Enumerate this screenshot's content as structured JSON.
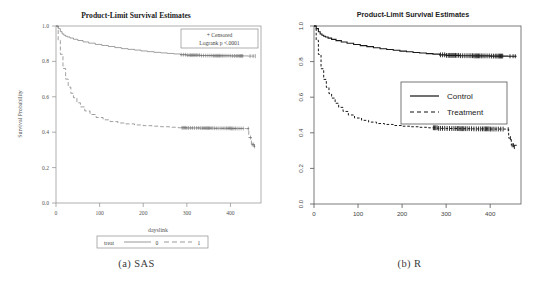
{
  "figure": {
    "subfigures": [
      {
        "key": "sas",
        "caption": "(a) SAS"
      },
      {
        "key": "r",
        "caption": "(b) R"
      }
    ]
  },
  "chart_data": [
    {
      "id": "sas",
      "type": "line",
      "software": "SAS",
      "title": "Product-Limit Survival Estimates",
      "xlabel": "dayslink",
      "ylabel": "Survival Probability",
      "xlim": [
        0,
        470
      ],
      "ylim": [
        0.0,
        1.0
      ],
      "xticks": [
        0,
        100,
        200,
        300,
        400
      ],
      "yticks": [
        0.0,
        0.2,
        0.4,
        0.6,
        0.8,
        1.0
      ],
      "xticklabels": [
        "0",
        "100",
        "200",
        "300",
        "400"
      ],
      "yticklabels": [
        "0.0",
        "0.2",
        "0.4",
        "0.6",
        "0.8",
        "1.0"
      ],
      "grid": false,
      "annotation_box": {
        "censored_note": "+ Censored",
        "logrank_note": "Logrank p <.0001"
      },
      "legend": {
        "position": "below-axis",
        "title": "treat",
        "entries": [
          {
            "label": "0",
            "style": "solid"
          },
          {
            "label": "1",
            "style": "dashed"
          }
        ]
      },
      "series": [
        {
          "name": "0",
          "style": "solid",
          "x": [
            0,
            5,
            10,
            14,
            18,
            22,
            26,
            32,
            40,
            50,
            62,
            75,
            90,
            105,
            120,
            135,
            150,
            165,
            180,
            195,
            210,
            225,
            240,
            255,
            270,
            285,
            300,
            330,
            360,
            400,
            440,
            455
          ],
          "y": [
            1.0,
            0.985,
            0.968,
            0.955,
            0.948,
            0.942,
            0.938,
            0.932,
            0.925,
            0.918,
            0.91,
            0.903,
            0.896,
            0.89,
            0.884,
            0.878,
            0.872,
            0.868,
            0.864,
            0.859,
            0.855,
            0.851,
            0.848,
            0.845,
            0.842,
            0.838,
            0.835,
            0.833,
            0.832,
            0.831,
            0.83,
            0.83
          ]
        },
        {
          "name": "1",
          "style": "dashed",
          "x": [
            0,
            5,
            10,
            16,
            22,
            28,
            34,
            40,
            48,
            56,
            66,
            78,
            92,
            108,
            124,
            142,
            160,
            180,
            200,
            220,
            240,
            260,
            280,
            300,
            330,
            360,
            400,
            435,
            442,
            448,
            455
          ],
          "y": [
            1.0,
            0.92,
            0.84,
            0.76,
            0.7,
            0.655,
            0.62,
            0.595,
            0.566,
            0.543,
            0.52,
            0.5,
            0.483,
            0.47,
            0.46,
            0.452,
            0.447,
            0.441,
            0.437,
            0.434,
            0.431,
            0.428,
            0.425,
            0.424,
            0.423,
            0.422,
            0.421,
            0.42,
            0.37,
            0.33,
            0.32
          ]
        }
      ],
      "censor_marks": {
        "series_0_range": [
          287,
          455
        ],
        "series_1_range": [
          288,
          455
        ]
      }
    },
    {
      "id": "r",
      "type": "line",
      "software": "R",
      "title": "Product-Limit Survival Estimates",
      "xlabel": "",
      "ylabel": "",
      "xlim": [
        0,
        470
      ],
      "ylim": [
        0.0,
        1.0
      ],
      "xticks": [
        0,
        100,
        200,
        300,
        400
      ],
      "yticks": [
        0.0,
        0.2,
        0.4,
        0.6,
        0.8,
        1.0
      ],
      "xticklabels": [
        "0",
        "100",
        "200",
        "300",
        "400"
      ],
      "yticklabels": [
        "0.0",
        "0.2",
        "0.4",
        "0.6",
        "0.8",
        "1.0"
      ],
      "grid": false,
      "legend": {
        "position": "inside-right",
        "entries": [
          {
            "label": "Control",
            "style": "solid"
          },
          {
            "label": "Treatment",
            "style": "dashed"
          }
        ]
      },
      "series": [
        {
          "name": "Control",
          "style": "solid",
          "x": [
            0,
            5,
            10,
            14,
            18,
            22,
            26,
            32,
            40,
            50,
            62,
            75,
            90,
            105,
            120,
            135,
            150,
            165,
            180,
            195,
            210,
            225,
            240,
            255,
            270,
            285,
            300,
            330,
            360,
            400,
            440,
            460
          ],
          "y": [
            1.0,
            0.985,
            0.968,
            0.955,
            0.948,
            0.942,
            0.938,
            0.932,
            0.925,
            0.918,
            0.91,
            0.903,
            0.896,
            0.89,
            0.884,
            0.878,
            0.872,
            0.868,
            0.864,
            0.859,
            0.855,
            0.851,
            0.848,
            0.845,
            0.842,
            0.838,
            0.835,
            0.833,
            0.832,
            0.831,
            0.83,
            0.83
          ]
        },
        {
          "name": "Treatment",
          "style": "dashed",
          "x": [
            0,
            5,
            10,
            16,
            22,
            28,
            34,
            40,
            48,
            56,
            66,
            78,
            92,
            108,
            124,
            142,
            160,
            180,
            200,
            220,
            240,
            260,
            280,
            300,
            330,
            360,
            400,
            435,
            442,
            448,
            460
          ],
          "y": [
            1.0,
            0.92,
            0.84,
            0.76,
            0.7,
            0.655,
            0.62,
            0.595,
            0.566,
            0.543,
            0.52,
            0.5,
            0.483,
            0.47,
            0.46,
            0.452,
            0.447,
            0.441,
            0.437,
            0.434,
            0.431,
            0.428,
            0.425,
            0.424,
            0.423,
            0.422,
            0.421,
            0.42,
            0.37,
            0.33,
            0.32
          ]
        }
      ],
      "censor_marks": {
        "series_0_range": [
          287,
          460
        ],
        "series_1_range": [
          270,
          460
        ]
      }
    }
  ]
}
